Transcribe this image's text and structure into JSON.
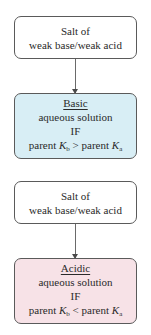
{
  "colors": {
    "basic_fill": "#d8eef5",
    "acidic_fill": "#f7e2e7",
    "border": "#5a5a5a"
  },
  "diagrams": [
    {
      "source": {
        "line1": "Salt of",
        "line2": "weak base/weak acid"
      },
      "result": {
        "title": "Basic",
        "line2": "aqueous solution",
        "line3": "IF",
        "condition": {
          "left_prefix": "parent",
          "left_symbol": "K",
          "left_sub": "b",
          "operator": ">",
          "right_prefix": "parent",
          "right_symbol": "K",
          "right_sub": "a"
        }
      }
    },
    {
      "source": {
        "line1": "Salt of",
        "line2": "weak base/weak acid"
      },
      "result": {
        "title": "Acidic",
        "line2": "aqueous solution",
        "line3": "IF",
        "condition": {
          "left_prefix": "parent",
          "left_symbol": "K",
          "left_sub": "b",
          "operator": "<",
          "right_prefix": "parent",
          "right_symbol": "K",
          "right_sub": "a"
        }
      }
    }
  ]
}
